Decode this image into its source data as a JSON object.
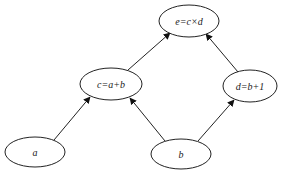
{
  "diagram": {
    "type": "computational-graph",
    "nodes": [
      {
        "id": "e",
        "label": "e=c×d",
        "cx": 189,
        "cy": 21,
        "rx": 30,
        "ry": 16
      },
      {
        "id": "c",
        "label": "c=a+b",
        "cx": 111,
        "cy": 84,
        "rx": 31,
        "ry": 16
      },
      {
        "id": "d",
        "label": "d=b+1",
        "cx": 250,
        "cy": 86,
        "rx": 27,
        "ry": 16
      },
      {
        "id": "a",
        "label": "a",
        "cx": 35,
        "cy": 152,
        "rx": 30,
        "ry": 15
      },
      {
        "id": "b",
        "label": "b",
        "cx": 181,
        "cy": 154,
        "rx": 30,
        "ry": 15
      }
    ],
    "edges": [
      {
        "from": "a",
        "to": "c"
      },
      {
        "from": "b",
        "to": "c"
      },
      {
        "from": "b",
        "to": "d"
      },
      {
        "from": "c",
        "to": "e"
      },
      {
        "from": "d",
        "to": "e"
      }
    ]
  }
}
